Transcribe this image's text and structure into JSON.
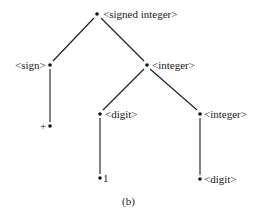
{
  "diagram": {
    "type": "parse-tree",
    "caption": "(b)",
    "nodes": {
      "root": {
        "label": "<signed integer>",
        "x": 97,
        "y": 14
      },
      "sign": {
        "label": "<sign>",
        "x": 50,
        "y": 65
      },
      "integer1": {
        "label": "<integer>",
        "x": 147,
        "y": 65
      },
      "plus": {
        "label": "+",
        "x": 50,
        "y": 126
      },
      "digit1": {
        "label": "<digit>",
        "x": 100,
        "y": 114
      },
      "integer2": {
        "label": "<integer>",
        "x": 200,
        "y": 114
      },
      "one": {
        "label": "1",
        "x": 100,
        "y": 178
      },
      "digit2": {
        "label": "<digit>",
        "x": 200,
        "y": 179
      }
    },
    "edges": [
      [
        "root",
        "sign"
      ],
      [
        "root",
        "integer1"
      ],
      [
        "sign",
        "plus"
      ],
      [
        "integer1",
        "digit1"
      ],
      [
        "integer1",
        "integer2"
      ],
      [
        "digit1",
        "one"
      ],
      [
        "integer2",
        "digit2"
      ]
    ]
  }
}
